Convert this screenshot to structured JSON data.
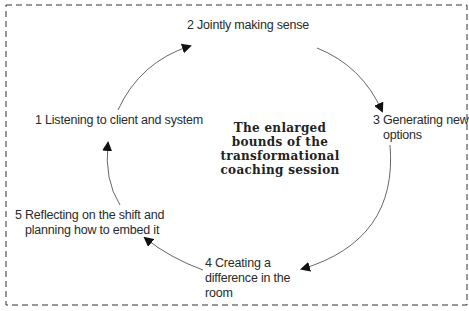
{
  "diagram": {
    "center_title": [
      "The enlarged",
      "bounds of the",
      "transformational",
      "coaching session"
    ],
    "steps": [
      {
        "number": 1,
        "lines": [
          "1 Listening to client and system"
        ]
      },
      {
        "number": 2,
        "lines": [
          "2 Jointly making sense"
        ]
      },
      {
        "number": 3,
        "lines": [
          "3 Generating new",
          "options"
        ]
      },
      {
        "number": 4,
        "lines": [
          "4 Creating a",
          "difference in the",
          "room"
        ]
      },
      {
        "number": 5,
        "lines": [
          "5 Reflecting on the shift and",
          "planning how to embed it"
        ]
      }
    ],
    "flow": [
      "1→2",
      "2→3",
      "3→4",
      "4→5",
      "5→1"
    ],
    "border_style": "dashed",
    "colors": {
      "line": "#555555",
      "arrowhead": "#111111",
      "text": "#2a2a2a"
    }
  }
}
